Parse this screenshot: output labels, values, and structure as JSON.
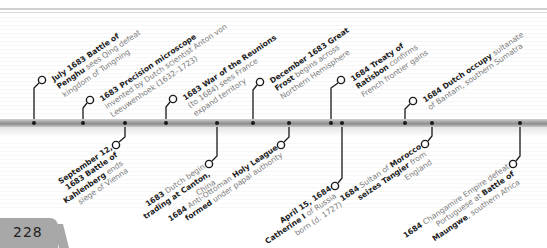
{
  "page": {
    "number": "228"
  },
  "timeline": {
    "bar_color": "#9b9b9b",
    "tick_color": "#1a1a1a"
  },
  "events_above": [
    {
      "id": "penghu",
      "tick_x": 34,
      "circle": [
        42,
        80
      ],
      "lines": [
        [
          {
            "b": "July 1683 Battle of"
          }
        ],
        [
          {
            "b": "Penghu"
          },
          {
            "t": " sees Qing defeat"
          }
        ],
        [
          {
            "t": "kingdom of Tungning"
          }
        ]
      ]
    },
    {
      "id": "microscope",
      "tick_x": 83,
      "circle": [
        90,
        100
      ],
      "lines": [
        [
          {
            "b": "1683 Precision microscope"
          }
        ],
        [
          {
            "t": "invented by Dutch scientist Anton von"
          }
        ],
        [
          {
            "t": "Leeuwenhoek (1632–1723)"
          }
        ]
      ]
    },
    {
      "id": "reunions",
      "tick_x": 166,
      "circle": [
        173,
        99
      ],
      "lines": [
        [
          {
            "b": "1683 War of the Reunions"
          }
        ],
        [
          {
            "t": "(to 1684) sees France"
          }
        ],
        [
          {
            "t": "expand territory"
          }
        ]
      ]
    },
    {
      "id": "great-frost",
      "tick_x": 253,
      "circle": [
        260,
        82
      ],
      "lines": [
        [
          {
            "b": "December 1683 Great"
          }
        ],
        [
          {
            "b": "Frost"
          },
          {
            "t": " begins across"
          }
        ],
        [
          {
            "t": "Northern Hemisphere"
          }
        ]
      ]
    },
    {
      "id": "ratisbon",
      "tick_x": 331,
      "circle": [
        341,
        80
      ],
      "lines": [
        [
          {
            "b": "1684 Treaty of"
          }
        ],
        [
          {
            "b": "Ratisbon"
          },
          {
            "t": " confirms"
          }
        ],
        [
          {
            "t": "French frontier gains"
          }
        ]
      ]
    },
    {
      "id": "bantam",
      "tick_x": 405,
      "circle": [
        413,
        101
      ],
      "lines": [
        [
          {
            "b": "1684 Dutch occupy"
          },
          {
            "t": " sultanate"
          }
        ],
        [
          {
            "t": "of Bantam, southern Sumatra"
          }
        ]
      ]
    }
  ],
  "events_below": [
    {
      "id": "kahlenberg",
      "tick_x": 125,
      "circle": [
        116,
        145
      ],
      "lines": [
        [
          {
            "b": "September 12,"
          }
        ],
        [
          {
            "b": "1683 Battle of"
          }
        ],
        [
          {
            "b": "Kahlenberg"
          },
          {
            "t": " ends"
          }
        ],
        [
          {
            "t": "siege of Vienna"
          }
        ]
      ]
    },
    {
      "id": "canton",
      "tick_x": 217,
      "circle": [
        209,
        164
      ],
      "lines": [
        [
          {
            "b": "1683"
          },
          {
            "t": " Dutch begin"
          }
        ],
        [
          {
            "b": "trading at Canton,"
          }
        ],
        [
          {
            "t": "China"
          }
        ]
      ]
    },
    {
      "id": "holy-league",
      "tick_x": 289,
      "circle": [
        281,
        145
      ],
      "lines": [
        [
          {
            "b": "1684"
          },
          {
            "t": " Anti-Ottoman "
          },
          {
            "b": "Holy League"
          }
        ],
        [
          {
            "b": "formed"
          },
          {
            "t": " under papal authority"
          }
        ]
      ]
    },
    {
      "id": "catherine",
      "tick_x": 342,
      "circle": [
        335,
        186
      ],
      "lines": [
        [
          {
            "b": "April 15, 1684"
          }
        ],
        [
          {
            "b": "Catherine I"
          },
          {
            "t": " of Russia"
          }
        ],
        [
          {
            "t": "born (d. 1727)"
          }
        ]
      ]
    },
    {
      "id": "tangier",
      "tick_x": 432,
      "circle": [
        425,
        144
      ],
      "lines": [
        [
          {
            "b": "1684"
          },
          {
            "t": " Sultan of "
          },
          {
            "b": "Morocco"
          }
        ],
        [
          {
            "b": "seizes Tangier"
          },
          {
            "t": " from"
          }
        ],
        [
          {
            "t": "England"
          }
        ]
      ]
    },
    {
      "id": "changamire",
      "tick_x": 520,
      "circle": [
        513,
        164
      ],
      "lines": [
        [
          {
            "b": "1684"
          },
          {
            "t": " Changamire Empire defeat"
          }
        ],
        [
          {
            "t": "Portuguese at "
          },
          {
            "b": "Battle of"
          }
        ],
        [
          {
            "b": "Maungwe"
          },
          {
            "t": ", southern Africa"
          }
        ]
      ]
    }
  ],
  "extra_ticks": [
    {
      "id": "tick-plain",
      "x": 520
    }
  ]
}
